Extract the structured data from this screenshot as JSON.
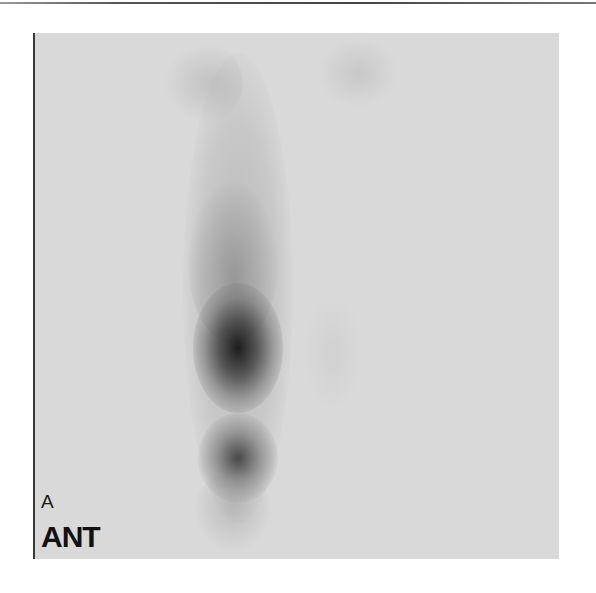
{
  "scan": {
    "panel_label": "A",
    "view_label": "ANT",
    "background_color": "#d9d9d9",
    "uptake_color": "#141414"
  }
}
